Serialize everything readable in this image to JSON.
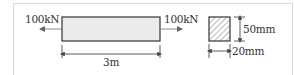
{
  "diagram": {
    "left_force": {
      "label": "100kN",
      "direction": "left"
    },
    "right_force": {
      "label": "100kN",
      "direction": "right"
    },
    "beam_length": {
      "label": "3m"
    },
    "cross_section": {
      "height_label": "50mm",
      "width_label": "20mm",
      "fill": "hatched"
    },
    "colors": {
      "beam_fill": "#ebebeb",
      "stroke": "#333333",
      "arrow": "#888888",
      "frame": "#d8d8d8"
    }
  }
}
